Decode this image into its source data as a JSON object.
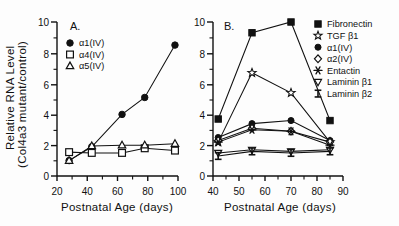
{
  "figure": {
    "panels": [
      "A",
      "B"
    ],
    "shared_xlabel": "Postnatal Age  (days)",
    "shared_ylabel_line1": "Relative RNA Level",
    "shared_ylabel_line2": "(Col4a3 mutant/control)"
  },
  "panelA": {
    "label": "A.",
    "xlabel": "Postnatal Age  (days)",
    "ylabel_line1": "Relative RNA Level",
    "ylabel_line2": "(Col4a3 mutant/control)",
    "xticks": [
      "20",
      "40",
      "60",
      "80",
      "100"
    ],
    "yticks": [
      "0",
      "2",
      "4",
      "6",
      "8",
      "10"
    ],
    "legend": [
      {
        "label": "α1(IV)",
        "marker": "filled-circle"
      },
      {
        "label": "α4(IV)",
        "marker": "open-square"
      },
      {
        "label": "α5(IV)",
        "marker": "open-triangle-up"
      }
    ]
  },
  "panelB": {
    "label": "B.",
    "xlabel": "Postnatal Age  (days)",
    "xticks": [
      "40",
      "50",
      "60",
      "70",
      "80",
      "90"
    ],
    "yticks": [
      "0",
      "2",
      "4",
      "6",
      "8",
      "10"
    ],
    "legend": [
      {
        "label": "Fibronectin",
        "marker": "filled-square"
      },
      {
        "label": "TGF  β1",
        "marker": "star"
      },
      {
        "label": "α1(IV)",
        "marker": "filled-circle"
      },
      {
        "label": "α2(IV)",
        "marker": "open-diamond"
      },
      {
        "label": "Entactin",
        "marker": "asterisk"
      },
      {
        "label": "Laminin  β1",
        "marker": "open-triangle-down"
      },
      {
        "label": "Laminin  β2",
        "marker": "ibeam"
      }
    ]
  },
  "chart_data": [
    {
      "type": "line",
      "panel": "A",
      "title": "A.",
      "xlabel": "Postnatal Age (days)",
      "ylabel": "Relative RNA Level (Col4a3 mutant/control)",
      "xlim": [
        20,
        100
      ],
      "ylim": [
        0,
        10
      ],
      "xticks": [
        20,
        40,
        60,
        80,
        100
      ],
      "yticks": [
        0,
        2,
        4,
        6,
        8,
        10
      ],
      "grid": false,
      "legend_position": "top-left",
      "x": [
        28,
        43,
        63,
        78,
        98
      ],
      "series": [
        {
          "name": "α1(IV)",
          "marker": "filled-circle",
          "values": [
            1.0,
            1.9,
            4.0,
            5.1,
            8.5
          ]
        },
        {
          "name": "α4(IV)",
          "marker": "open-square",
          "values": [
            1.55,
            1.5,
            1.5,
            1.8,
            1.65
          ]
        },
        {
          "name": "α5(IV)",
          "marker": "open-triangle-up",
          "values": [
            1.0,
            1.95,
            2.0,
            2.0,
            2.1
          ]
        }
      ]
    },
    {
      "type": "line",
      "panel": "B",
      "title": "B.",
      "xlabel": "Postnatal Age (days)",
      "ylabel": "Relative RNA Level (Col4a3 mutant/control)",
      "xlim": [
        40,
        90
      ],
      "ylim": [
        0,
        10
      ],
      "xticks": [
        40,
        50,
        60,
        70,
        80,
        90
      ],
      "yticks": [
        0,
        2,
        4,
        6,
        8,
        10
      ],
      "grid": false,
      "legend_position": "top-right",
      "x": [
        42,
        55,
        70,
        85
      ],
      "series": [
        {
          "name": "Fibronectin",
          "marker": "filled-square",
          "values": [
            3.7,
            9.3,
            10.0,
            3.6
          ]
        },
        {
          "name": "TGF β1",
          "marker": "star",
          "values": [
            2.2,
            6.7,
            5.4,
            2.2
          ]
        },
        {
          "name": "α1(IV)",
          "marker": "filled-circle",
          "values": [
            2.5,
            3.4,
            3.6,
            2.3
          ]
        },
        {
          "name": "α2(IV)",
          "marker": "open-diamond",
          "values": [
            2.3,
            3.1,
            2.9,
            2.2
          ]
        },
        {
          "name": "Entactin",
          "marker": "asterisk",
          "values": [
            2.2,
            3.0,
            2.9,
            2.0
          ]
        },
        {
          "name": "Laminin β1",
          "marker": "open-triangle-down",
          "values": [
            1.5,
            1.7,
            1.6,
            1.7
          ]
        },
        {
          "name": "Laminin β2",
          "marker": "ibeam",
          "values": [
            1.3,
            1.6,
            1.5,
            1.6
          ]
        }
      ]
    }
  ]
}
